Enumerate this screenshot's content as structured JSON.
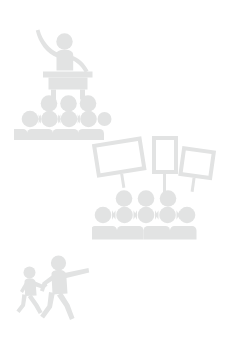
{
  "page": {
    "background_color": "#ffffff",
    "width": 230,
    "height": 356
  },
  "palette": {
    "pictogram_fill": "#e2e3e3",
    "pictogram_fill_light": "#e8e9e9",
    "background": "#ffffff"
  },
  "illustrations": [
    {
      "name": "speaker-addressing-audience",
      "caption": "",
      "position": {
        "x": 14,
        "y": 24,
        "width": 100,
        "height": 116
      },
      "parts": [
        {
          "name": "speaker-figure",
          "description": "standing presenter with one arm raised"
        },
        {
          "name": "podium",
          "description": "lectern table in front of the speaker"
        },
        {
          "name": "audience-back-row",
          "count": 3
        },
        {
          "name": "audience-middle-row",
          "count": 4
        },
        {
          "name": "audience-front-row",
          "count": 4
        }
      ]
    },
    {
      "name": "protest-crowd-with-placards",
      "caption": "",
      "position": {
        "x": 92,
        "y": 134,
        "width": 126,
        "height": 116
      },
      "parts": [
        {
          "name": "placard-left",
          "orientation": "landscape",
          "tilt_degrees": -9,
          "label": ""
        },
        {
          "name": "placard-center",
          "orientation": "portrait",
          "tilt_degrees": 0,
          "label": ""
        },
        {
          "name": "placard-right",
          "orientation": "landscape",
          "tilt_degrees": 8,
          "label": ""
        },
        {
          "name": "crowd-back-row",
          "count": 3
        },
        {
          "name": "crowd-middle-row",
          "count": 4
        },
        {
          "name": "crowd-front-row",
          "count": 4
        }
      ]
    },
    {
      "name": "two-walking-figures",
      "caption": "",
      "position": {
        "x": 12,
        "y": 252,
        "width": 90,
        "height": 84
      },
      "parts": [
        {
          "name": "small-walking-figure",
          "description": "smaller person striding, trailing behind"
        },
        {
          "name": "large-walking-figure",
          "description": "larger person striding with arm outstretched forward"
        }
      ]
    }
  ]
}
